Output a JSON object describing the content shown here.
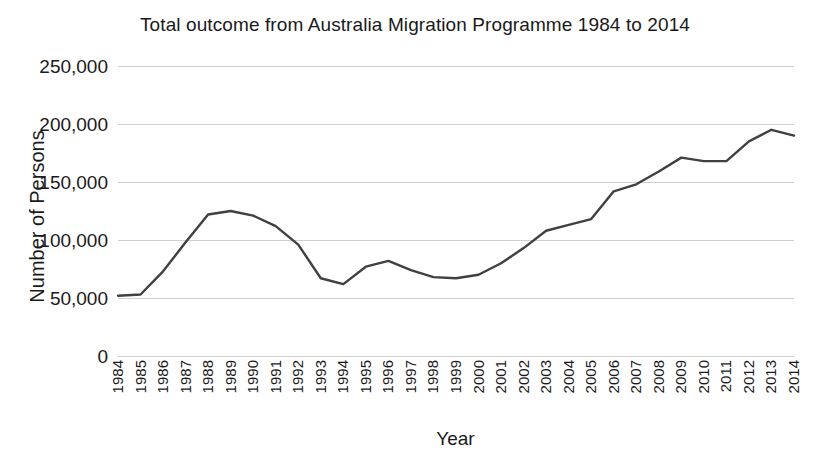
{
  "chart_data": {
    "type": "line",
    "title": "Total outcome from Australia Migration Programme 1984 to 2014",
    "xlabel": "Year",
    "ylabel": "Number of Persons",
    "grid": true,
    "legend": false,
    "line_color": "#404040",
    "grid_color": "#cfcfcf",
    "ylim": [
      0,
      250000
    ],
    "ytick_labels": [
      "250,000",
      "200,000",
      "150,000",
      "100,000",
      "50,000",
      "0"
    ],
    "ytick_values": [
      250000,
      200000,
      150000,
      100000,
      50000,
      0
    ],
    "categories": [
      "1984",
      "1985",
      "1986",
      "1987",
      "1988",
      "1989",
      "1990",
      "1991",
      "1992",
      "1993",
      "1994",
      "1995",
      "1996",
      "1997",
      "1998",
      "1999",
      "2000",
      "2001",
      "2002",
      "2003",
      "2004",
      "2005",
      "2006",
      "2007",
      "2008",
      "2009",
      "2010",
      "2011",
      "2012",
      "2013",
      "2014"
    ],
    "values": [
      52000,
      53000,
      73000,
      98000,
      122000,
      125000,
      121000,
      112000,
      96000,
      67000,
      62000,
      77000,
      82000,
      74000,
      68000,
      67000,
      70000,
      80000,
      93000,
      108000,
      113000,
      118000,
      142000,
      148000,
      159000,
      171000,
      168000,
      168000,
      185000,
      195000,
      190000
    ]
  }
}
